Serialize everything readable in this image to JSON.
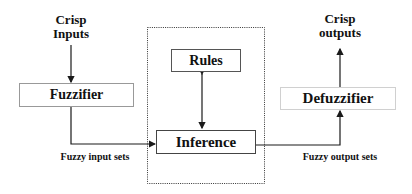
{
  "diagram": {
    "input_label_line1": "Crisp",
    "input_label_line2": "Inputs",
    "output_label_line1": "Crisp",
    "output_label_line2": "outputs",
    "fuzzifier": "Fuzzifier",
    "rules": "Rules",
    "inference": "Inference",
    "defuzzifier": "Defuzzifier",
    "fuzzy_input_sets": "Fuzzy input sets",
    "fuzzy_output_sets": "Fuzzy output sets"
  },
  "colors": {
    "line": "#1a1a1a",
    "box_border": "#555555",
    "light_box_border": "#c8c8c8"
  }
}
